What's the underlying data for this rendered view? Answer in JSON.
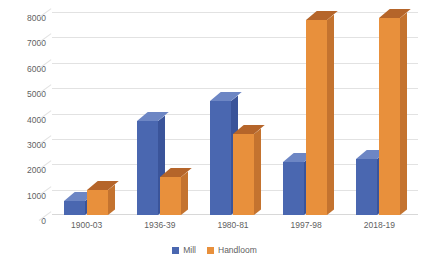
{
  "chart_data": {
    "type": "bar",
    "title": "",
    "subtitle": "",
    "xlabel": "",
    "ylabel": "",
    "categories": [
      "1900-03",
      "1936-39",
      "1980-81",
      "1997-98",
      "2018-19"
    ],
    "series": [
      {
        "name": "Mill",
        "color": "#4a67b0",
        "values": [
          550,
          3700,
          4500,
          2100,
          2200
        ]
      },
      {
        "name": "Handloom",
        "color": "#e8903c",
        "values": [
          1000,
          1500,
          3200,
          7700,
          7750
        ]
      }
    ],
    "ylim": [
      0,
      8000
    ],
    "yticks": [
      0,
      1000,
      2000,
      3000,
      4000,
      5000,
      6000,
      7000,
      8000
    ],
    "ytick_labels": [
      "0",
      "1000",
      "2000",
      "3000",
      "4000",
      "5000",
      "6000",
      "7000",
      "8000"
    ],
    "grid": true,
    "legend_position": "bottom",
    "style": "3d-column"
  },
  "legend": {
    "items": [
      {
        "label": "Mill",
        "color": "#4a67b0"
      },
      {
        "label": "Handloom",
        "color": "#e8903c"
      }
    ]
  }
}
